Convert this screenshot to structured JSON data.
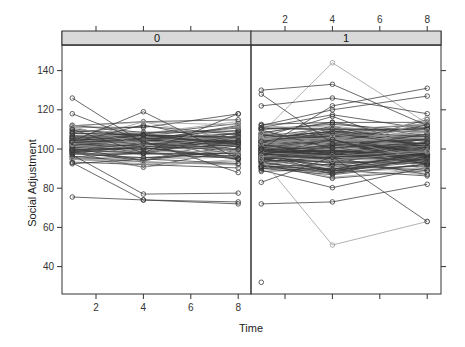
{
  "chart_data": {
    "type": "line",
    "subtype": "spaghetti / trellis panel plot (lattice xyplot, grouped by subject)",
    "xlabel": "Time",
    "ylabel": "Social Adjustment",
    "x_ticks": [
      2,
      4,
      6,
      8
    ],
    "y_ticks": [
      40,
      60,
      80,
      100,
      120,
      140
    ],
    "xlim": [
      0.5,
      8.6
    ],
    "ylim": [
      27,
      155
    ],
    "x_observation_times": [
      1,
      4,
      8
    ],
    "grid": false,
    "legend": null,
    "panels": [
      {
        "strip_label": "0",
        "n_subjects_approx": 80,
        "value_range_t1": [
          75,
          126
        ],
        "value_range_t4": [
          73,
          119
        ],
        "value_range_t8": [
          71,
          118
        ],
        "central_band": [
          90,
          115
        ],
        "highlighted_trajectories": [
          {
            "t1": 126,
            "t4": 103,
            "t8": 100
          },
          {
            "t1": 104,
            "t4": 119,
            "t8": 95
          },
          {
            "t1": 75.5,
            "t4": 74,
            "t8": 73
          },
          {
            "t1": 97,
            "t4": 77,
            "t8": 77.5
          },
          {
            "t1": 93,
            "t4": 74,
            "t8": 72
          },
          {
            "t1": 110,
            "t4": 98,
            "t8": 118
          },
          {
            "t1": 118,
            "t4": 104,
            "t8": 88
          }
        ]
      },
      {
        "strip_label": "1",
        "n_subjects_approx": 160,
        "value_range_t1": [
          32,
          130
        ],
        "value_range_t4": [
          51,
          144
        ],
        "value_range_t8": [
          63,
          131
        ],
        "central_band": [
          85,
          115
        ],
        "highlighted_trajectories": [
          {
            "t1": 108,
            "t4": 144,
            "t8": 113
          },
          {
            "t1": 130,
            "t4": 133,
            "t8": 112
          },
          {
            "t1": 128,
            "t4": 103,
            "t8": 105
          },
          {
            "t1": 122,
            "t4": 126,
            "t8": 118
          },
          {
            "t1": 95,
            "t4": 51,
            "t8": 63
          },
          {
            "t1": 83,
            "t4": 96,
            "t8": 63
          },
          {
            "t1": 72,
            "t4": 73,
            "t8": 82
          },
          {
            "t1": 32,
            "t4": null,
            "t8": null
          },
          {
            "t1": 100,
            "t4": 122,
            "t8": 131
          },
          {
            "t1": 112,
            "t4": 120,
            "t8": 127
          }
        ]
      }
    ]
  },
  "panels": {
    "left": {
      "strip": "0"
    },
    "right": {
      "strip": "1"
    }
  },
  "axes": {
    "xlabel": "Time",
    "ylabel": "Social Adjustment",
    "x_tick_labels": [
      "2",
      "4",
      "6",
      "8"
    ],
    "y_tick_labels": [
      "140",
      "120",
      "100",
      "80",
      "60",
      "40"
    ]
  },
  "colors": {
    "strip_bg": "#d9d9d9",
    "axis": "#333333",
    "line_dark": "#3a3a3a",
    "line_light": "#9a9a9a"
  }
}
